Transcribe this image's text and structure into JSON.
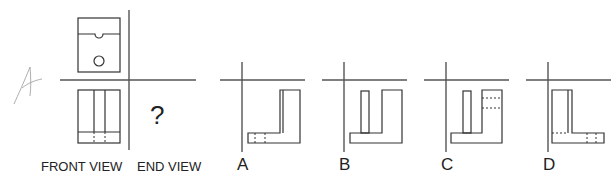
{
  "problem": {
    "handwritten_mark": "A",
    "question_mark": "?",
    "given_views": {
      "front_view_label": "FRONT VIEW",
      "end_view_label": "END VIEW"
    },
    "options": [
      {
        "letter": "A"
      },
      {
        "letter": "B"
      },
      {
        "letter": "C"
      },
      {
        "letter": "D"
      }
    ]
  }
}
